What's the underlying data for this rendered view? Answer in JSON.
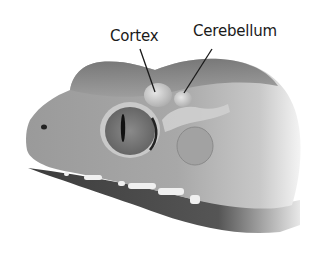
{
  "figure": {
    "style": "grayscale illustration",
    "labels": [
      {
        "id": "cortex",
        "text": "Cortex"
      },
      {
        "id": "cerebellum",
        "text": "Cerebellum"
      }
    ],
    "colors": {
      "background": "#ffffff",
      "skin_light": "#b5b5b5",
      "skin_mid": "#8f8f8f",
      "skin_dark": "#5a5a5a",
      "mouth": "#3a3a3a",
      "brain": "#d6d6d6",
      "teeth": "#f0f0f0",
      "leader_line": "#1a1a1a"
    }
  }
}
